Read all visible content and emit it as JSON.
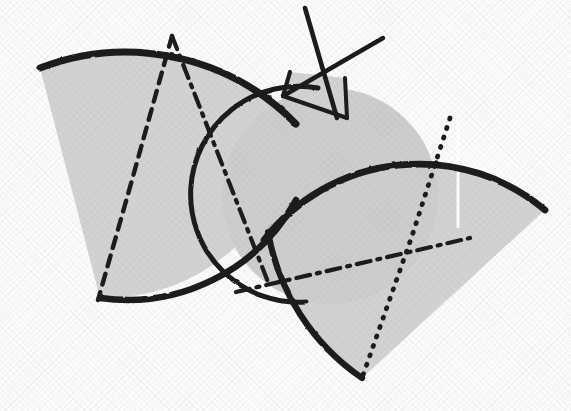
{
  "figure": {
    "canvas": {
      "width": 571,
      "height": 411
    },
    "colors": {
      "background": "#fdfdfd",
      "paper_tint": "#f7f7f7",
      "ink": "#1b1b1b",
      "fill_gray": "#d2d2d2",
      "fill_gray_dark": "#c9c9c9",
      "highlight_white": "#ffffff"
    },
    "stroke_widths": {
      "solid_heavy": 6.5,
      "solid_medium": 4.0,
      "antenna": 4.5,
      "dash_dot": 4.2,
      "dotted": 4.6,
      "highlight": 2.6
    },
    "dash_patterns": {
      "dash_dot": "14 7 3 7",
      "dashed": "11 8",
      "dotted": "1 9"
    }
  },
  "shapes": {
    "left_wing": {
      "name": "left-wing-sector",
      "fill": "#d2d2d2",
      "path": "M 40 68 L 100 298 A 192 192 0 0 0 296 124 A 238 238 0 0 0 40 68 Z"
    },
    "right_wing": {
      "name": "right-wing-sector",
      "fill": "#d2d2d2",
      "path": "M 362 378 L 545 210 A 196 196 0 0 0 264 240 A 224 224 0 0 0 362 378 Z"
    },
    "body_circle": {
      "name": "body-circle",
      "fill": "#cdcdcd",
      "cx": 330,
      "cy": 196,
      "r": 108
    },
    "antenna_box": {
      "name": "antenna-quadrilateral",
      "fill": "#d2d2d2",
      "path": "M 283 96 L 290 72 L 345 78 L 347 118 Z"
    }
  },
  "strokes": {
    "left_wing_outer_arc": "M 40 68 A 238 238 0 0 1 296 124",
    "left_wing_lower_arc": "M 100 298 A 192 192 0 0 0 296 200",
    "right_wing_outer_arc": "M 264 240 A 196 196 0 0 1 545 210",
    "right_wing_lower_arc": "M 362 378 A 224 224 0 0 1 268 232",
    "body_circle_arc": "M 318 88 A 108 108 0 1 0 306 302",
    "antenna_vertical": "M 305 8 L 337 118",
    "antenna_diagonal": "M 383 38 L 283 96",
    "box_left_edge": "M 283 96 L 290 72",
    "box_bottom_edge": "M 283 96 L 347 118",
    "box_right_edge": "M 345 78 L 347 118"
  },
  "guides": {
    "left_wing_radius_dash_dot": {
      "label": "left-wing-radius-dash-dot",
      "path": "M 172 36 L 132 180 L 98 300",
      "pattern": "dashed"
    },
    "left_wing_chord_dash_dot": {
      "label": "left-wing-chord-dash-dot",
      "path": "M 172 36 L 268 282",
      "pattern": "dash_dot"
    },
    "right_wing_radius_dash_dot": {
      "label": "right-wing-radius-dash-dot",
      "path": "M 450 118 L 412 236 L 362 378",
      "pattern": "dotted"
    },
    "right_wing_chord_dash_dot": {
      "label": "right-wing-chord-dash-dot",
      "path": "M 236 292 L 470 238",
      "pattern": "dash_dot"
    },
    "right_wing_white_highlight": {
      "label": "right-wing-white-highlight",
      "path": "M 458 118 L 458 228",
      "pattern": "solid"
    }
  },
  "labels": {
    "figure_caption": ""
  }
}
